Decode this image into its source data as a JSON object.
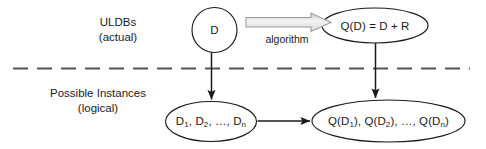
{
  "diagram": {
    "colors": {
      "stroke": "#1a1a1a",
      "text": "#1a1a1a",
      "divider": "#555555",
      "block_arrow_outline": "#9a9a9a",
      "block_arrow_fill_light": "#f2f2f2",
      "block_arrow_fill_dark": "#c8c8c8",
      "background": "#ffffff"
    },
    "bands": [
      {
        "id": "actual",
        "label_line1": "ULDBs",
        "label_line2": "(actual)"
      },
      {
        "id": "logical",
        "label_line1": "Possible Instances",
        "label_line2": "(logical)"
      }
    ],
    "nodes": [
      {
        "id": "d-circle",
        "shape": "circle",
        "label": "D"
      },
      {
        "id": "qd-ellipse",
        "shape": "ellipse",
        "label": "Q(D) = D + R"
      },
      {
        "id": "instances-ellipse",
        "shape": "ellipse",
        "label_parts": [
          "D",
          "1",
          ", D",
          "2",
          ", …, D",
          "n"
        ],
        "label_plain": "D1, D2, …, Dn"
      },
      {
        "id": "query-instances-ellipse",
        "shape": "ellipse",
        "label_parts": [
          "Q(D",
          "1",
          "), Q(D",
          "2",
          "), …, Q(D",
          "n",
          ")"
        ],
        "label_plain": "Q(D1), Q(D2), …, Q(Dn)"
      }
    ],
    "edges": [
      {
        "id": "algorithm-arrow",
        "style": "block-arrow",
        "label": "algorithm",
        "from": "d-circle",
        "to": "qd-ellipse"
      },
      {
        "id": "d-to-instances-arrow",
        "style": "plain-arrow",
        "label": "",
        "from": "d-circle",
        "to": "instances-ellipse"
      },
      {
        "id": "qd-to-query-instances-arrow",
        "style": "plain-arrow",
        "label": "",
        "from": "qd-ellipse",
        "to": "query-instances-ellipse"
      },
      {
        "id": "instances-to-query-instances-arrow",
        "style": "plain-arrow",
        "label": "",
        "from": "instances-ellipse",
        "to": "query-instances-ellipse"
      }
    ],
    "divider": {
      "id": "band-divider",
      "style": "dashed"
    }
  }
}
